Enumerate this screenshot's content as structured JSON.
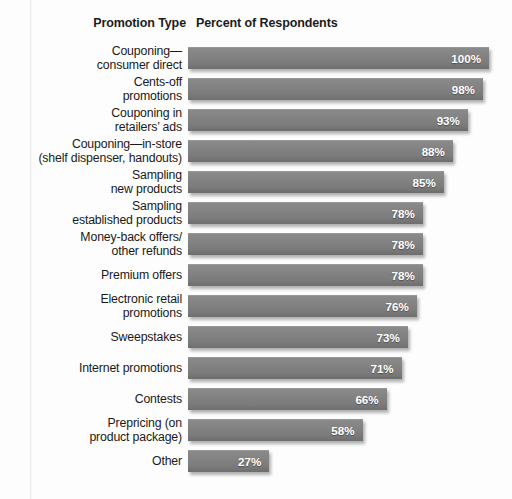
{
  "header": {
    "category_label": "Promotion Type",
    "value_label": "Percent of Respondents"
  },
  "style": {
    "bar_color": "#808080",
    "value_text_color": "#ffffff",
    "background": "#ffffff"
  },
  "chart_data": {
    "type": "bar",
    "orientation": "horizontal",
    "title": "",
    "subtitle": "",
    "xlabel": "Percent of Respondents",
    "ylabel": "Promotion Type",
    "xlim": [
      0,
      103
    ],
    "grid": false,
    "legend": null,
    "value_suffix": "%",
    "categories": [
      "Couponing—\nconsumer direct",
      "Cents-off\npromotions",
      "Couponing in\nretailers’ ads",
      "Couponing—in-store\n(shelf dispenser, handouts)",
      "Sampling\nnew products",
      "Sampling\nestablished products",
      "Money-back offers/\nother refunds",
      "Premium offers",
      "Electronic retail\npromotions",
      "Sweepstakes",
      "Internet promotions",
      "Contests",
      "Prepricing (on\nproduct package)",
      "Other"
    ],
    "values": [
      100,
      98,
      93,
      88,
      85,
      78,
      78,
      78,
      76,
      73,
      71,
      66,
      58,
      27
    ],
    "data_labels": [
      "100%",
      "98%",
      "93%",
      "88%",
      "85%",
      "78%",
      "78%",
      "78%",
      "76%",
      "73%",
      "71%",
      "66%",
      "58%",
      "27%"
    ]
  }
}
